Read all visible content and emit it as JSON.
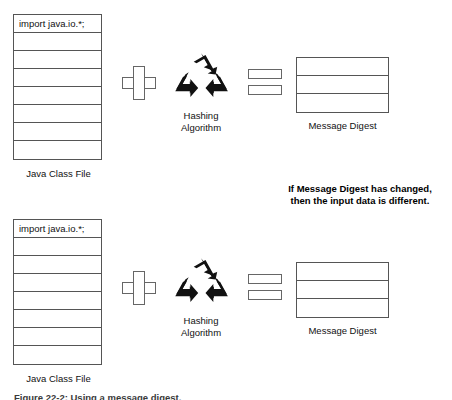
{
  "figure": {
    "background": "#ffffff",
    "line_color": "#555555",
    "text_color": "#111111",
    "caption_partial": "Figure 22-2: Using a message digest."
  },
  "flows": [
    {
      "id": "flow-top",
      "class_file": {
        "caption": "Java Class File",
        "line_count": 8,
        "lines": [
          {
            "text": "import java.io.*;"
          },
          {
            "text": ""
          },
          {
            "text": ""
          },
          {
            "text": ""
          },
          {
            "text": ""
          },
          {
            "text": ""
          },
          {
            "text": ""
          },
          {
            "text": ""
          }
        ]
      },
      "plus_operator": {
        "symbol": "+",
        "name": "plus-sign"
      },
      "hashing": {
        "icon": "recycle-icon",
        "caption_line1": "Hashing",
        "caption_line2": "Algorithm"
      },
      "equals_operator": {
        "symbol": "=",
        "name": "equals-sign"
      },
      "digest": {
        "caption": "Message Digest",
        "line_count": 3
      }
    },
    {
      "id": "flow-bottom",
      "class_file": {
        "caption": "Java Class File",
        "line_count": 8,
        "lines": [
          {
            "text": "import java.io.*;"
          },
          {
            "text": ""
          },
          {
            "text": ""
          },
          {
            "text": ""
          },
          {
            "text": ""
          },
          {
            "text": ""
          },
          {
            "text": ""
          },
          {
            "text": ""
          }
        ]
      },
      "plus_operator": {
        "symbol": "+",
        "name": "plus-sign"
      },
      "hashing": {
        "icon": "recycle-icon",
        "caption_line1": "Hashing",
        "caption_line2": "Algorithm"
      },
      "equals_operator": {
        "symbol": "=",
        "name": "equals-sign"
      },
      "digest": {
        "caption": "Message Digest",
        "line_count": 3
      }
    }
  ],
  "note": {
    "line1": "If Message Digest has changed,",
    "line2": "then the input data is different."
  }
}
